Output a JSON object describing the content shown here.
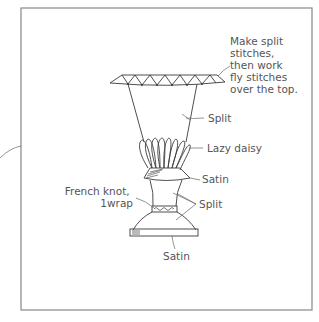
{
  "diagram": {
    "colors": {
      "line": "#3a3a3a",
      "label": "#555555",
      "frame": "#888888",
      "background": "#ffffff"
    },
    "labels": {
      "top_note": [
        "Make split",
        "stitches,",
        "then work",
        "fly stitches",
        "over the top."
      ],
      "split_upper": "Split",
      "lazy_daisy": "Lazy daisy",
      "satin_collar": "Satin",
      "french_knot": [
        "French knot,",
        "1wrap"
      ],
      "split_lower": "Split",
      "satin_base": "Satin"
    }
  }
}
